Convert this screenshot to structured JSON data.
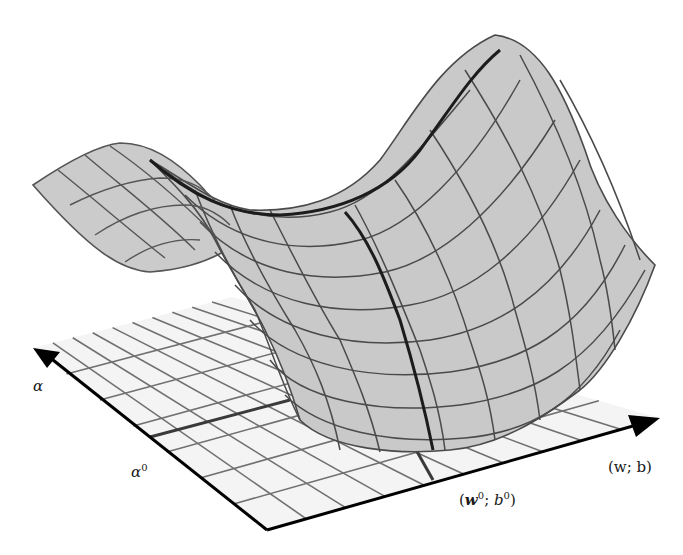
{
  "figure": {
    "colors": {
      "background": "#ffffff",
      "plane_fill": "#f4f4f4",
      "plane_grid": "#6e6e6e",
      "surface_fill": "#c9c9c9",
      "surface_grid": "#4a4a4a",
      "highlight_line": "#1c1c1c",
      "axis": "#000000"
    },
    "axes": {
      "alpha_axis": {
        "label": "α",
        "label_math": "alpha"
      },
      "wb_axis": {
        "label": "(w; b)",
        "label_math": "(w; b)"
      }
    },
    "markers": {
      "alpha0": {
        "label": "α",
        "superscript": "0"
      },
      "wb0": {
        "label_w": "w",
        "label_b": "b",
        "superscript": "0"
      }
    }
  }
}
